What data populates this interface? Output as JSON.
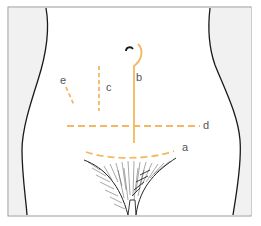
{
  "figure": {
    "incision_color": "#f3b861",
    "outline_color": "#1a1a1a",
    "side_shade_color": "#f1f1f1",
    "frame_color": "#9a9a9a"
  },
  "labels": {
    "a": "a",
    "b": "b",
    "c": "c",
    "d": "d",
    "e": "e"
  },
  "incisions": [
    {
      "id": "a",
      "name": "Pfannenstiel (suprapubic transverse)",
      "style": "dashed curve"
    },
    {
      "id": "b",
      "name": "Midline with periumbilical curve",
      "style": "solid"
    },
    {
      "id": "c",
      "name": "Paramedian",
      "style": "dashed vertical"
    },
    {
      "id": "d",
      "name": "Transverse",
      "style": "dashed horizontal"
    },
    {
      "id": "e",
      "name": "Oblique (gridiron)",
      "style": "dashed oblique"
    }
  ]
}
